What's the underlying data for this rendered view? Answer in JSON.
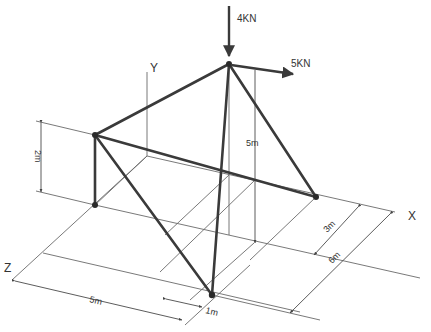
{
  "diagram": {
    "type": "3D truss / tripod isometric diagram",
    "axes": {
      "x_label": "X",
      "y_label": "Y",
      "z_label": "Z"
    },
    "loads": [
      {
        "label": "4KN",
        "direction": "down (-Y)",
        "applied_at": "apex"
      },
      {
        "label": "5KN",
        "direction": "+X",
        "applied_at": "apex"
      }
    ],
    "dimensions": {
      "left_support_height": "2m",
      "apex_height": "5m",
      "right_support_offset": "3m",
      "x_total": "6m",
      "z_distance": "5m",
      "bottom_support_offset": "1m"
    },
    "nodes": {
      "apex": "A",
      "left_top": "B",
      "right_support": "C",
      "bottom_support": "D"
    },
    "colors": {
      "members": "#3a3a3a",
      "construction_lines": "#6a6a6a",
      "background": "#ffffff"
    }
  }
}
